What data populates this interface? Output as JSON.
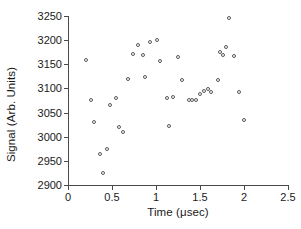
{
  "chart_data": {
    "type": "scatter",
    "title": "",
    "xlabel": "Time (μsec)",
    "ylabel": "Signal (Arb. Units)",
    "xlim": [
      0,
      2.5
    ],
    "ylim": [
      2900,
      3250
    ],
    "xticks": [
      0,
      0.5,
      1,
      1.5,
      2,
      2.5
    ],
    "xtick_labels": [
      "0",
      "0.5",
      "1",
      "1.5",
      "2",
      "2.5"
    ],
    "yticks": [
      2900,
      2950,
      3000,
      3050,
      3100,
      3150,
      3200,
      3250
    ],
    "ytick_labels": [
      "2900",
      "2950",
      "3000",
      "3050",
      "3100",
      "3150",
      "3200",
      "3250"
    ],
    "grid": false,
    "legend": false,
    "marker": "open-circle",
    "marker_color": "#585858",
    "series": [
      {
        "name": "Signal",
        "points": [
          [
            0.2,
            3158
          ],
          [
            0.26,
            3077
          ],
          [
            0.3,
            3031
          ],
          [
            0.36,
            2965
          ],
          [
            0.4,
            2924
          ],
          [
            0.44,
            2974
          ],
          [
            0.48,
            3065
          ],
          [
            0.54,
            3080
          ],
          [
            0.58,
            3020
          ],
          [
            0.63,
            3009
          ],
          [
            0.68,
            3119
          ],
          [
            0.74,
            3171
          ],
          [
            0.8,
            3189
          ],
          [
            0.85,
            3170
          ],
          [
            0.87,
            3123
          ],
          [
            0.93,
            3197
          ],
          [
            1.01,
            3200
          ],
          [
            1.04,
            3157
          ],
          [
            1.12,
            3080
          ],
          [
            1.15,
            3022
          ],
          [
            1.19,
            3082
          ],
          [
            1.25,
            3166
          ],
          [
            1.3,
            3117
          ],
          [
            1.38,
            3076
          ],
          [
            1.41,
            3076
          ],
          [
            1.45,
            3076
          ],
          [
            1.5,
            3089
          ],
          [
            1.55,
            3095
          ],
          [
            1.59,
            3098
          ],
          [
            1.63,
            3093
          ],
          [
            1.7,
            3117
          ],
          [
            1.73,
            3176
          ],
          [
            1.76,
            3170
          ],
          [
            1.79,
            3185
          ],
          [
            1.83,
            3245
          ],
          [
            1.89,
            3168
          ],
          [
            1.94,
            3093
          ],
          [
            2.0,
            3034
          ]
        ]
      }
    ]
  },
  "figure": {
    "background_color": "#ffffff",
    "axis_color": "#4a4a4a",
    "text_color": "#1a1a1a"
  }
}
